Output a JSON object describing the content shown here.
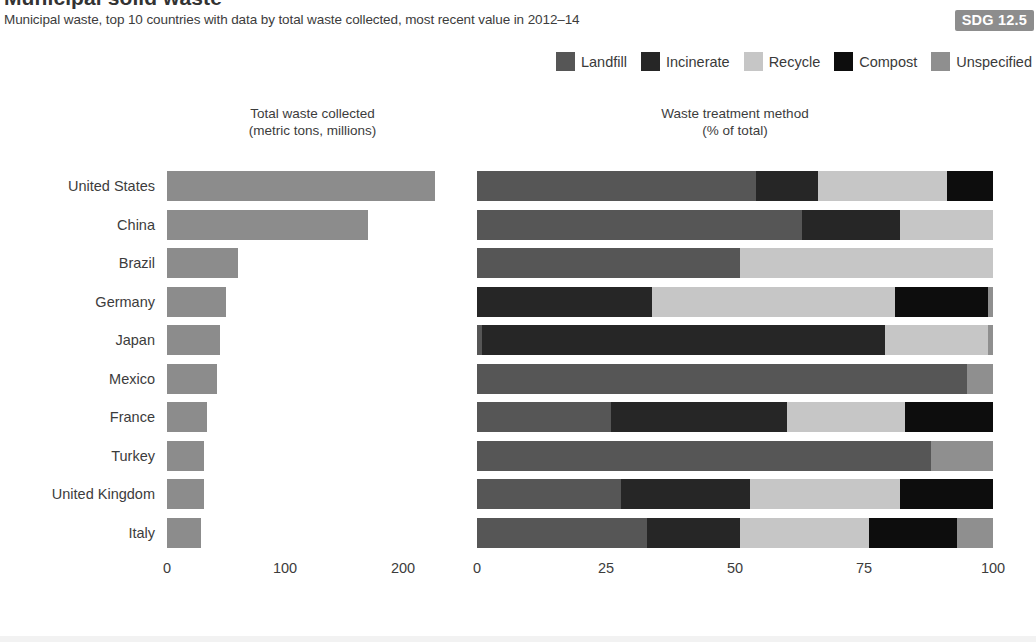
{
  "header": {
    "title": "Municipal solid waste",
    "subtitle": "Municipal waste, top 10 countries with data by total waste collected, most recent value in 2012–14",
    "badge": "SDG 12.5"
  },
  "panels": {
    "left_title": "Total waste collected",
    "left_subtitle": "(metric tons, millions)",
    "right_title": "Waste treatment method",
    "right_subtitle": "(% of total)"
  },
  "colors": {
    "landfill": "#565656",
    "incinerate": "#262626",
    "recycle": "#c6c6c6",
    "compost": "#0d0d0d",
    "unspecified": "#8f8f8f",
    "total_bar": "#8c8c8c",
    "badge_bg": "#8d8d8d",
    "text": "#3c3c3c"
  },
  "chart_data": [
    {
      "type": "bar",
      "title": "Total waste collected",
      "subtitle": "(metric tons, millions)",
      "xlabel": "",
      "ylabel": "",
      "orientation": "horizontal",
      "xlim": [
        0,
        250
      ],
      "xticks": [
        0,
        100,
        200
      ],
      "xticklabels": [
        "0",
        "100",
        "200"
      ],
      "grid": false,
      "categories": [
        "United States",
        "China",
        "Brazil",
        "Germany",
        "Japan",
        "Mexico",
        "France",
        "Turkey",
        "United Kingdom",
        "Italy"
      ],
      "values": [
        227,
        170,
        60,
        50,
        45,
        42,
        34,
        31,
        31,
        29
      ],
      "series_name": "Total waste collected (million metric tons)"
    },
    {
      "type": "bar",
      "subtype": "stacked-100",
      "title": "Waste treatment method",
      "subtitle": "(% of total)",
      "xlabel": "",
      "ylabel": "",
      "orientation": "horizontal",
      "xlim": [
        0,
        100
      ],
      "xticks": [
        0,
        25,
        50,
        75,
        100
      ],
      "xticklabels": [
        "0",
        "25",
        "50",
        "75",
        "100"
      ],
      "grid": false,
      "legend_position": "top-right",
      "categories": [
        "United States",
        "China",
        "Brazil",
        "Germany",
        "Japan",
        "Mexico",
        "France",
        "Turkey",
        "United Kingdom",
        "Italy"
      ],
      "series": [
        {
          "name": "Landfill",
          "color": "#565656",
          "values": [
            54,
            63,
            51,
            0,
            1,
            95,
            26,
            88,
            28,
            33
          ]
        },
        {
          "name": "Incinerate",
          "color": "#262626",
          "values": [
            12,
            19,
            0,
            34,
            78,
            0,
            34,
            0,
            25,
            18
          ]
        },
        {
          "name": "Recycle",
          "color": "#c6c6c6",
          "values": [
            25,
            18,
            49,
            47,
            20,
            0,
            23,
            0,
            29,
            25
          ]
        },
        {
          "name": "Compost",
          "color": "#0d0d0d",
          "values": [
            9,
            0,
            0,
            18,
            0,
            0,
            17,
            0,
            18,
            17
          ]
        },
        {
          "name": "Unspecified",
          "color": "#8f8f8f",
          "values": [
            0,
            0,
            0,
            1,
            1,
            5,
            0,
            12,
            0,
            7
          ]
        }
      ]
    }
  ],
  "legend": [
    {
      "label": "Landfill",
      "icon": "legend-swatch-landfill",
      "color": "#565656"
    },
    {
      "label": "Incinerate",
      "icon": "legend-swatch-incinerate",
      "color": "#262626"
    },
    {
      "label": "Recycle",
      "icon": "legend-swatch-recycle",
      "color": "#c6c6c6"
    },
    {
      "label": "Compost",
      "icon": "legend-swatch-compost",
      "color": "#0d0d0d"
    },
    {
      "label": "Unspecified",
      "icon": "legend-swatch-unspecified",
      "color": "#8f8f8f"
    }
  ]
}
